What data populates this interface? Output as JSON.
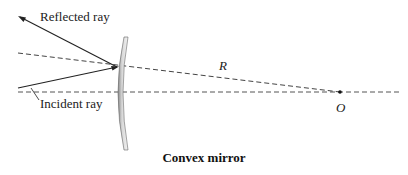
{
  "diagram": {
    "caption": "Convex mirror",
    "labels": {
      "reflected_ray": "Reflected ray",
      "incident_ray": "Incident ray",
      "radius": "R",
      "center": "O"
    },
    "colors": {
      "line": "#222222",
      "mirror_fill": "#cfcfcf",
      "mirror_edge": "#555555",
      "dashed": "#444444"
    }
  }
}
